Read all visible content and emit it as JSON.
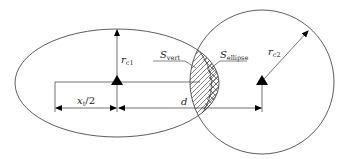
{
  "diagram": {
    "labels": {
      "r_c1": "r",
      "r_c1_sub": "c1",
      "r_c2": "r",
      "r_c2_sub": "c2",
      "x_t_half": "x",
      "x_t_half_sub": "t",
      "x_t_half_tail": "/2",
      "d": "d",
      "S_vert": "S",
      "S_vert_sub": "vert",
      "S_ellipse": "S",
      "S_ellipse_sub": "ellipse"
    },
    "shapes": {
      "ellipse": {
        "cx": 117,
        "cy": 83,
        "rx": 102,
        "ry": 54
      },
      "circle": {
        "cx": 262,
        "cy": 82,
        "r": 72
      }
    },
    "colors": {
      "stroke": "#333333",
      "marker": "#000000",
      "background": "#ffffff"
    }
  }
}
